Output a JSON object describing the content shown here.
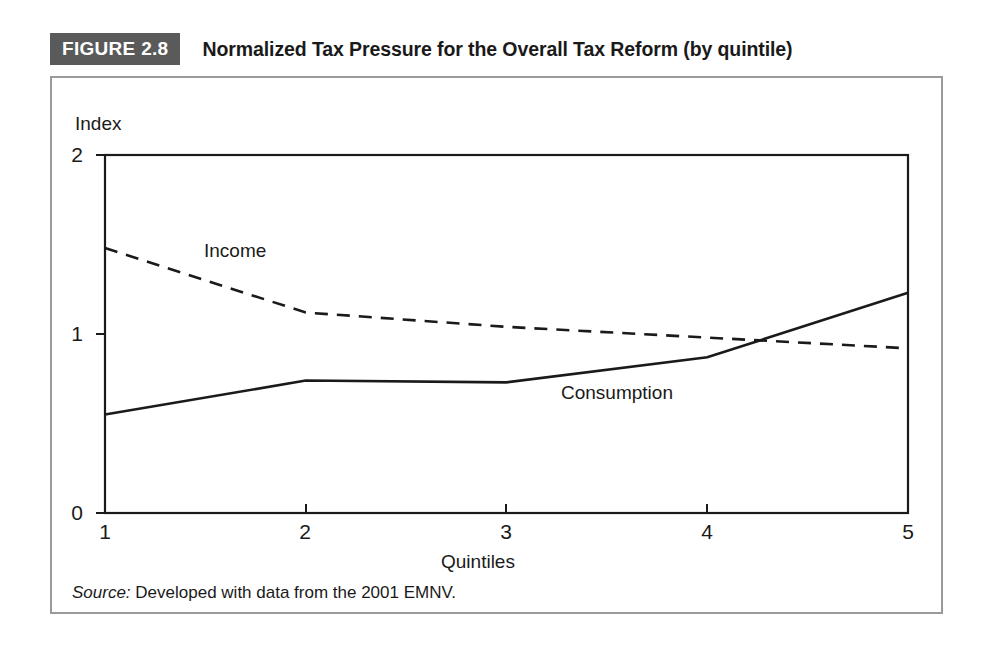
{
  "figure": {
    "badge": "FIGURE 2.8",
    "title": "Normalized Tax Pressure for the Overall Tax Reform (by quintile)",
    "source_prefix": "Source:",
    "source_text": " Developed with data from the 2001 EMNV.",
    "badge_color": "#5a5a5a",
    "frame_color": "#9a9a9a",
    "ink_color": "#1a1a1a"
  },
  "chart_data": {
    "type": "line",
    "title": "Normalized Tax Pressure for the Overall Tax Reform (by quintile)",
    "xlabel": "Quintiles",
    "ylabel": "Index",
    "x": [
      1,
      2,
      3,
      4,
      5
    ],
    "xtick_labels": [
      "1",
      "2",
      "3",
      "4",
      "5"
    ],
    "ytick_labels": [
      "0",
      "1",
      "2"
    ],
    "yticks": [
      0,
      1,
      2
    ],
    "xlim": [
      1,
      5
    ],
    "ylim": [
      0,
      2
    ],
    "grid": false,
    "legend": "inline-annotations",
    "series": [
      {
        "name": "Income",
        "style": "dashed",
        "color": "#1a1a1a",
        "values": [
          1.48,
          1.12,
          1.04,
          0.98,
          0.92
        ],
        "label_position": {
          "x": 1.55,
          "y": 1.42
        }
      },
      {
        "name": "Consumption",
        "style": "solid",
        "color": "#1a1a1a",
        "values": [
          0.55,
          0.74,
          0.73,
          0.87,
          1.23
        ],
        "label_position": {
          "x": 3.35,
          "y": 0.7
        }
      }
    ],
    "annotations": [
      {
        "text": "Income",
        "series": "Income"
      },
      {
        "text": "Consumption",
        "series": "Consumption"
      }
    ]
  }
}
